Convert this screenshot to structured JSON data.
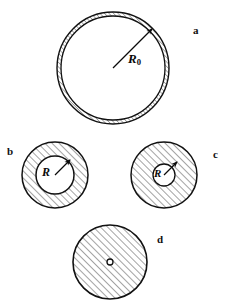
{
  "figure": {
    "width": 230,
    "height": 304,
    "background_color": "#ffffff",
    "line_color": "#111111",
    "hatch_color": "#333333",
    "hatch_angle_deg": 45,
    "panel_label_color": "#111111"
  },
  "panels": [
    {
      "id": "a",
      "label": "a",
      "label_x": 193,
      "label_y": 25,
      "description": "thin hatched annular shell, large empty interior",
      "center_x": 113,
      "center_y": 68,
      "outer_radius": 56,
      "inner_radius": 52,
      "fill": "hatched-annulus",
      "radius_label": "R",
      "radius_subscript": "0",
      "radius_label_x": 128,
      "radius_label_y": 58,
      "arrow_from_x": 113,
      "arrow_from_y": 68,
      "arrow_to_x": 152,
      "arrow_to_y": 29
    },
    {
      "id": "b",
      "label": "b",
      "label_x": 7,
      "label_y": 146,
      "description": "thick hatched annulus with medium empty core",
      "center_x": 55,
      "center_y": 175,
      "outer_radius": 33,
      "inner_radius": 19,
      "fill": "hatched-annulus",
      "radius_label": "R",
      "radius_subscript": "",
      "radius_label_x": 45,
      "radius_label_y": 170,
      "arrow_from_x": 55,
      "arrow_from_y": 175,
      "arrow_to_x": 69,
      "arrow_to_y": 161
    },
    {
      "id": "c",
      "label": "c",
      "label_x": 213,
      "label_y": 149,
      "description": "hatched disk with small empty core",
      "center_x": 164,
      "center_y": 175,
      "outer_radius": 33,
      "inner_radius": 11,
      "fill": "hatched-annulus",
      "radius_label": "R",
      "radius_subscript": "",
      "radius_label_x": 156,
      "radius_label_y": 170,
      "arrow_from_x": 164,
      "arrow_from_y": 175,
      "arrow_to_x": 175,
      "arrow_to_y": 164
    },
    {
      "id": "d",
      "label": "d",
      "label_x": 157,
      "label_y": 234,
      "description": "fully hatched disk collapsed to a point at centre",
      "center_x": 110,
      "center_y": 262,
      "outer_radius": 37,
      "inner_radius": 3,
      "fill": "hatched-disk-with-point",
      "radius_label": "",
      "radius_subscript": "",
      "arrow_from_x": 0,
      "arrow_from_y": 0,
      "arrow_to_x": 0,
      "arrow_to_y": 0
    }
  ]
}
